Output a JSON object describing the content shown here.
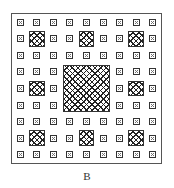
{
  "figure": {
    "label": "B",
    "grid_size": 9,
    "large_squares": [
      {
        "row": 3,
        "col": 3,
        "span": 3
      }
    ],
    "medium_squares": [
      {
        "row": 1,
        "col": 1
      },
      {
        "row": 1,
        "col": 4
      },
      {
        "row": 1,
        "col": 7
      },
      {
        "row": 4,
        "col": 1
      },
      {
        "row": 4,
        "col": 7
      },
      {
        "row": 7,
        "col": 1
      },
      {
        "row": 7,
        "col": 4
      },
      {
        "row": 7,
        "col": 7
      }
    ],
    "colors": {
      "line": "#333333",
      "hatch": "#222222",
      "background": "#ffffff"
    }
  }
}
